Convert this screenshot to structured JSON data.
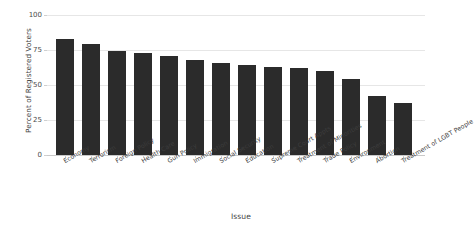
{
  "chart_data": {
    "type": "bar",
    "title": "",
    "xlabel": "Issue",
    "ylabel": "Percent of Registered Voters",
    "categories": [
      "Economy",
      "Terrorism",
      "Foreign Policy",
      "Health Care",
      "Gun Policy",
      "Immigration",
      "Social Security",
      "Education",
      "Supreme Court Appts",
      "Treatment of Minorities",
      "Trade Policy",
      "Environment",
      "Abortion",
      "Treatment of LGBT People"
    ],
    "values": [
      83,
      79,
      74,
      73,
      71,
      68,
      66,
      64,
      63,
      62,
      60,
      54,
      42,
      37
    ],
    "ylim": [
      0,
      100
    ],
    "yticks": [
      0,
      25,
      50,
      75,
      100
    ],
    "ytick_labels": [
      "0",
      "25",
      "50",
      "75",
      "100"
    ],
    "grid": true,
    "legend": "none",
    "bar_color": "#2b2b2b",
    "grid_color": "#e6e6e6",
    "background_color": "#ffffff"
  }
}
